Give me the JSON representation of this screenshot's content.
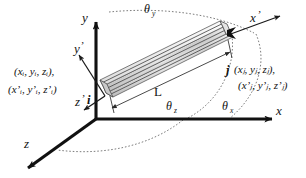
{
  "figure": {
    "type": "diagram",
    "background": "#ffffff",
    "ink_color": "#111111",
    "dash_color": "#6e6e6e",
    "beam_fill": "#d9d9d9"
  },
  "axes": {
    "global": [
      {
        "id": "x-axis",
        "label": "x",
        "direction": "right"
      },
      {
        "id": "y-axis",
        "label": "y",
        "direction": "up"
      },
      {
        "id": "z-axis",
        "label": "z",
        "direction": "down-left"
      }
    ],
    "local": [
      {
        "id": "x-prime-axis",
        "label": "x",
        "prime": "’",
        "direction": "up-right"
      },
      {
        "id": "y-prime-axis",
        "label": "y",
        "prime": "’",
        "direction": "up-right"
      },
      {
        "id": "z-prime-axis",
        "label": "z",
        "prime": "’",
        "direction": "down-left"
      }
    ]
  },
  "nodes": [
    {
      "id": "node-i",
      "name": "i",
      "global_coords": "(xᵢ, yᵢ, zᵢ),",
      "local_coords": "(x’ᵢ, y’ᵢ, z’ᵢ)"
    },
    {
      "id": "node-j",
      "name": "j",
      "global_coords": "(xⱼ, yⱼ, zⱼ),",
      "local_coords": "(x’ⱼ, y’ⱼ, z’ⱼ)"
    }
  ],
  "annotations": {
    "length_label": "L",
    "angles": [
      {
        "id": "theta-y",
        "symbol": "θ",
        "subscript": "y",
        "position": "top"
      },
      {
        "id": "theta-z",
        "symbol": "θ",
        "subscript": "z",
        "position": "middle"
      },
      {
        "id": "theta-x",
        "symbol": "θ",
        "subscript": "x",
        "position": "right"
      }
    ]
  },
  "element": {
    "id": "beam-element",
    "shape": "prismatic-member",
    "hatched": true
  }
}
